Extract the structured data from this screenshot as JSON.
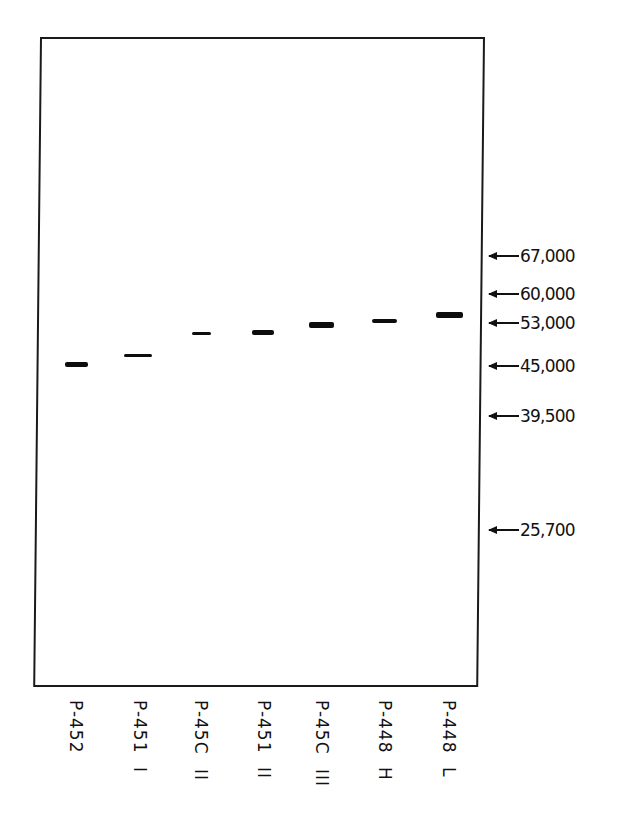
{
  "figure": {
    "type": "gel-electrophoresis",
    "frame_color": "#1a1a1a",
    "band_color": "#0d0d0d"
  },
  "markers": [
    {
      "label": "67,000",
      "value": 67000,
      "y": 256
    },
    {
      "label": "60,000",
      "value": 60000,
      "y": 294
    },
    {
      "label": "53,000",
      "value": 53000,
      "y": 323
    },
    {
      "label": "45,000",
      "value": 45000,
      "y": 366
    },
    {
      "label": "39,500",
      "value": 39500,
      "y": 416
    },
    {
      "label": "25,700",
      "value": 25700,
      "y": 530
    }
  ],
  "lanes": [
    {
      "id": "P-452",
      "suffix": "",
      "x": 76,
      "band": {
        "x": 65,
        "y": 362,
        "w": 23,
        "h": 5
      }
    },
    {
      "id": "P-451",
      "suffix": "I",
      "x": 140,
      "band": {
        "x": 124,
        "y": 354,
        "w": 28,
        "h": 3
      }
    },
    {
      "id": "P-45C",
      "suffix": "II",
      "x": 201,
      "band": {
        "x": 192,
        "y": 332,
        "w": 19,
        "h": 3
      }
    },
    {
      "id": "P-451",
      "suffix": "II",
      "x": 264,
      "band": {
        "x": 252,
        "y": 330,
        "w": 22,
        "h": 5
      }
    },
    {
      "id": "P-45C",
      "suffix": "III",
      "x": 322,
      "band": {
        "x": 309,
        "y": 322,
        "w": 25,
        "h": 6
      }
    },
    {
      "id": "P-448",
      "suffix": "H",
      "x": 385,
      "band": {
        "x": 372,
        "y": 319,
        "w": 25,
        "h": 4
      }
    },
    {
      "id": "P-448",
      "suffix": "L",
      "x": 449,
      "band": {
        "x": 436,
        "y": 312,
        "w": 27,
        "h": 6
      }
    }
  ]
}
